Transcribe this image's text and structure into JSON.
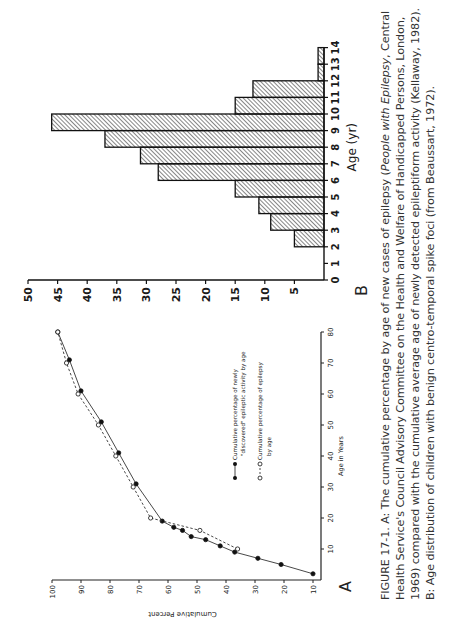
{
  "figure": {
    "panel_a_label": "A",
    "panel_b_label": "B",
    "caption_lines": [
      {
        "pre": "FIGURE 17-1.  A: The cumulative percentage by age of new cases of epilepsy (",
        "italic": "People with Epilepsy",
        "post": ", Central"
      },
      {
        "pre": "Health Service's Council Advisory Committee on the Health and Welfare of Handicapped Persons, London,",
        "italic": "",
        "post": ""
      },
      {
        "pre": "1969) compared with the cumulative average age of newly detected epileptiform activity (Kellaway, 1982).",
        "italic": "",
        "post": ""
      },
      {
        "pre": "B: Age distribution of children with benign centro-temporal spike foci (from Beaussart, 1972).",
        "italic": "",
        "post": ""
      }
    ]
  },
  "chart_data": [
    {
      "panel": "A",
      "type": "line",
      "title": "",
      "xlabel": "Age in Years",
      "ylabel": "Cumulative Percent",
      "xlim": [
        0,
        80
      ],
      "ylim": [
        10,
        100
      ],
      "x_ticks": [
        10,
        20,
        30,
        40,
        50,
        60,
        70,
        80
      ],
      "y_ticks": [
        10,
        20,
        30,
        40,
        50,
        60,
        70,
        80,
        90,
        100
      ],
      "grid": false,
      "legend_position": "inside, lower right",
      "series": [
        {
          "name": "Cumulative percentage of newly \"discovered\" epileptic activity by age",
          "marker": "filled-circle",
          "line": "solid",
          "points": [
            [
              2,
              10
            ],
            [
              5,
              21
            ],
            [
              7,
              29
            ],
            [
              9,
              37
            ],
            [
              11,
              42
            ],
            [
              13,
              47
            ],
            [
              14,
              52
            ],
            [
              16,
              55
            ],
            [
              17,
              58
            ],
            [
              19,
              62
            ],
            [
              31,
              71
            ],
            [
              41,
              77
            ],
            [
              51,
              83
            ],
            [
              61,
              90
            ],
            [
              71,
              94
            ],
            [
              80,
              98
            ]
          ]
        },
        {
          "name": "Cumulative percentage of epilepsy by age",
          "marker": "open-circle",
          "line": "dashed",
          "points": [
            [
              10,
              36
            ],
            [
              16,
              49
            ],
            [
              20,
              66
            ],
            [
              30,
              72
            ],
            [
              40,
              78
            ],
            [
              50,
              84
            ],
            [
              60,
              91
            ],
            [
              70,
              95
            ],
            [
              80,
              98
            ]
          ]
        }
      ]
    },
    {
      "panel": "B",
      "type": "bar",
      "title": "",
      "xlabel": "Age (yr)",
      "ylabel": "",
      "categories": [
        "2-3",
        "3-4",
        "4-5",
        "5-6",
        "6-7",
        "7-8",
        "8-9",
        "9-10",
        "10-11",
        "11-12",
        "12-13",
        "13-14"
      ],
      "values": [
        5,
        9,
        11,
        15,
        28,
        31,
        37,
        46,
        15,
        12,
        1,
        1
      ],
      "x_ticks": [
        0,
        1,
        2,
        3,
        4,
        5,
        6,
        7,
        8,
        9,
        10,
        11,
        12,
        13,
        14
      ],
      "y_ticks": [
        0,
        5,
        10,
        15,
        20,
        25,
        30,
        35,
        40,
        45,
        50
      ],
      "ylim": [
        0,
        50
      ],
      "fill": "diagonal hatch"
    }
  ]
}
